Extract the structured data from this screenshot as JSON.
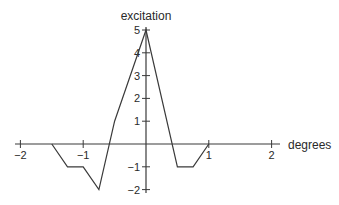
{
  "chart_data": {
    "type": "line",
    "title": "",
    "xlabel": "degrees",
    "ylabel": "excitation",
    "xlim": [
      -2,
      2
    ],
    "ylim": [
      -2,
      5
    ],
    "grid": false,
    "legend": null,
    "x_ticks": [
      -2,
      -1,
      1,
      2
    ],
    "x_tick_labels": [
      "−2",
      "−1",
      "1",
      "2"
    ],
    "y_ticks": [
      -2,
      -1,
      1,
      2,
      3,
      4,
      5
    ],
    "y_tick_labels": [
      "−2",
      "−1",
      "1",
      "2",
      "3",
      "4",
      "5"
    ],
    "series": [
      {
        "name": "excitation profile",
        "x": [
          -1.5,
          -1.25,
          -1.0,
          -0.75,
          -0.5,
          0.0,
          0.5,
          0.75,
          1.0
        ],
        "y": [
          0,
          -1,
          -1,
          -2,
          1,
          5,
          -1,
          -1,
          0
        ]
      }
    ],
    "colors": {
      "line": "#3a3a3a",
      "axis": "#3a3a3a",
      "text": "#2a2a2a"
    }
  }
}
